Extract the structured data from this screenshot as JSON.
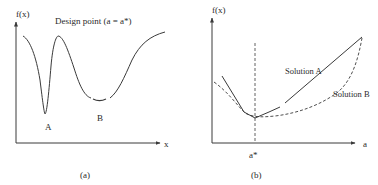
{
  "panel_a": {
    "caption": "(a)",
    "title": "Design point (a = a*)",
    "y_axis_label": "f(x)",
    "x_axis_label": "x",
    "minimum_labels": [
      "A",
      "B"
    ],
    "curve_description": "Multimodal function with sharp narrow minimum A and broad shallow minimum B"
  },
  "panel_b": {
    "caption": "(b)",
    "y_axis_label": "f(x)",
    "x_axis_label": "a",
    "design_point_label": "a*",
    "series": [
      {
        "name": "Solution A",
        "style": "solid"
      },
      {
        "name": "Solution B",
        "style": "dashed"
      }
    ]
  },
  "colors": {
    "ink": "#3a3a3a",
    "background": "#ffffff"
  }
}
